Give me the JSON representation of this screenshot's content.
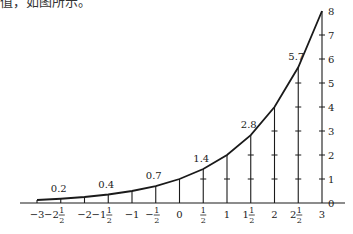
{
  "caption": "值，如图所示。",
  "chart_data": {
    "type": "line",
    "title": "",
    "xlabel": "",
    "ylabel": "",
    "x": [
      -3,
      -2.5,
      -2,
      -1.5,
      -1,
      -0.5,
      0,
      0.5,
      1,
      1.5,
      2,
      2.5,
      3
    ],
    "values": [
      0.125,
      0.177,
      0.25,
      0.354,
      0.5,
      0.707,
      1,
      1.414,
      2,
      2.828,
      4,
      5.657,
      8
    ],
    "x_tick_labels": [
      "−3",
      "−2½",
      "−2",
      "−1½",
      "−1",
      "−½",
      "0",
      "½",
      "1",
      "1½",
      "2",
      "2½",
      "3"
    ],
    "y_tick_labels": [
      "0",
      "1",
      "2",
      "3",
      "4",
      "5",
      "6",
      "7",
      "8"
    ],
    "annotations": [
      {
        "x": -2.5,
        "text": "0.2"
      },
      {
        "x": -1.5,
        "text": "0.4"
      },
      {
        "x": -0.5,
        "text": "0.7"
      },
      {
        "x": 0.5,
        "text": "1.4"
      },
      {
        "x": 1.5,
        "text": "2.8"
      },
      {
        "x": 2.5,
        "text": "5.7"
      }
    ],
    "xlim": [
      -3,
      3
    ],
    "ylim": [
      0,
      8
    ],
    "grid": false,
    "legend": "none"
  }
}
